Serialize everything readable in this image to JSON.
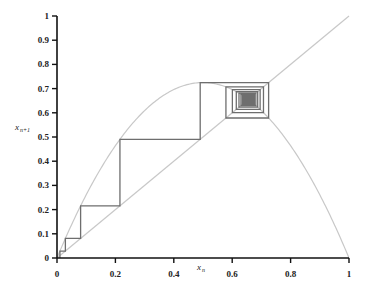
{
  "chart_data": {
    "type": "line",
    "title": "",
    "xlabel": "x_n",
    "ylabel": "x_{n+1}",
    "xlim": [
      0,
      1
    ],
    "ylim": [
      0,
      1
    ],
    "grid": false,
    "x_ticks": [
      "0",
      "0.2",
      "0.4",
      "0.6",
      "0.8",
      "1"
    ],
    "y_ticks": [
      "0",
      "0.1",
      "0.2",
      "0.3",
      "0.4",
      "0.5",
      "0.6",
      "0.7",
      "0.8",
      "0.9",
      "1"
    ],
    "series": [
      {
        "name": "map curve",
        "function": "r*x*(1-x)",
        "r": 2.9,
        "color": "#c8c8c8"
      },
      {
        "name": "identity line",
        "function": "x",
        "color": "#c8c8c8"
      },
      {
        "name": "cobweb",
        "x0": 0.01,
        "iterations": 40,
        "color": "#6e6e6e",
        "first_values": [
          0.01,
          0.0287,
          0.0809,
          0.2156,
          0.4904,
          0.7247,
          0.5786,
          0.7071,
          0.6006,
          0.6957,
          0.6144,
          0.687
        ]
      }
    ],
    "fixed_point": 0.6552
  },
  "labels": {
    "x_main": "x",
    "x_sub": "n",
    "y_main": "x",
    "y_sub": "n+1"
  }
}
